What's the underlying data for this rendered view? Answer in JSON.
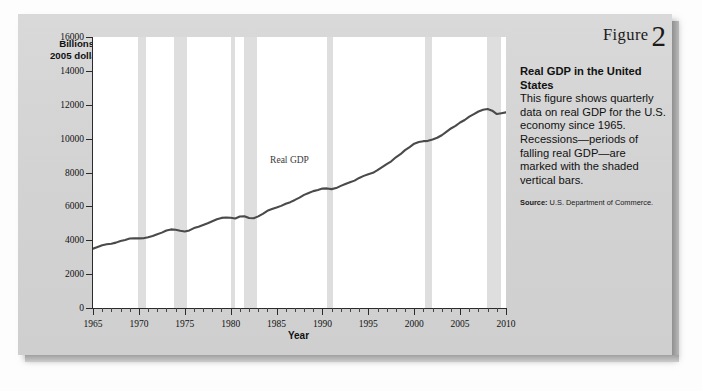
{
  "figure": {
    "label_word": "Figure",
    "number": "2",
    "caption_title": "Real GDP in the United States",
    "caption_body": "This figure shows quarterly data on real GDP for the U.S. economy since 1965. Recessions—periods of falling real GDP—are marked with the shaded vertical bars.",
    "source_label": "Source:",
    "source_text": "U.S. Department of Commerce."
  },
  "colors": {
    "panel_background": "#d5d5d5",
    "plot_background": "#ffffff",
    "line": "#4a4a4a",
    "recession_bar": "#dedede",
    "axis": "#2b2b2b",
    "text": "#111111"
  },
  "chart_data": {
    "type": "line",
    "title": "Real GDP in the United States",
    "xlabel": "Year",
    "ylabel": "Billions of 2005 dollars",
    "ylabel_line1": "Billions of",
    "ylabel_line2": "2005 dollars",
    "xlim": [
      1965,
      2010
    ],
    "ylim": [
      0,
      16000
    ],
    "yticks": [
      0,
      2000,
      4000,
      6000,
      8000,
      10000,
      12000,
      14000,
      16000
    ],
    "ytick_labels": [
      "0",
      "2000",
      "4000",
      "6000",
      "8000",
      "10000",
      "12000",
      "14000",
      "16000"
    ],
    "xticks": [
      1965,
      1970,
      1975,
      1980,
      1985,
      1990,
      1995,
      2000,
      2005,
      2010
    ],
    "xtick_labels": [
      "1965",
      "1970",
      "1975",
      "1980",
      "1985",
      "1990",
      "1995",
      "2000",
      "2005",
      "2010"
    ],
    "x_minor_tick_step": 1,
    "grid": false,
    "legend": "none",
    "series": [
      {
        "name": "Real GDP",
        "annotation": "Real GDP",
        "annotation_x": 1989.2,
        "annotation_y": 8700,
        "x": [
          1965,
          1965.5,
          1966,
          1966.5,
          1967,
          1967.5,
          1968,
          1968.5,
          1969,
          1969.5,
          1970,
          1970.5,
          1971,
          1971.5,
          1972,
          1972.5,
          1973,
          1973.5,
          1974,
          1974.5,
          1975,
          1975.5,
          1976,
          1976.5,
          1977,
          1977.5,
          1978,
          1978.5,
          1979,
          1979.5,
          1980,
          1980.5,
          1981,
          1981.5,
          1982,
          1982.5,
          1983,
          1983.5,
          1984,
          1984.5,
          1985,
          1985.5,
          1986,
          1986.5,
          1987,
          1987.5,
          1988,
          1988.5,
          1989,
          1989.5,
          1990,
          1990.5,
          1991,
          1991.5,
          1992,
          1992.5,
          1993,
          1993.5,
          1994,
          1994.5,
          1995,
          1995.5,
          1996,
          1996.5,
          1997,
          1997.5,
          1998,
          1998.5,
          1999,
          1999.5,
          2000,
          2000.5,
          2001,
          2001.5,
          2002,
          2002.5,
          2003,
          2003.5,
          2004,
          2004.5,
          2005,
          2005.5,
          2006,
          2006.5,
          2007,
          2007.5,
          2008,
          2008.5,
          2009,
          2009.5,
          2010
        ],
        "y": [
          3500,
          3600,
          3700,
          3760,
          3790,
          3860,
          3960,
          4020,
          4100,
          4120,
          4110,
          4120,
          4180,
          4250,
          4350,
          4450,
          4580,
          4640,
          4620,
          4560,
          4520,
          4580,
          4720,
          4800,
          4900,
          5000,
          5120,
          5240,
          5320,
          5340,
          5330,
          5280,
          5400,
          5420,
          5310,
          5300,
          5410,
          5560,
          5740,
          5840,
          5930,
          6030,
          6150,
          6250,
          6380,
          6520,
          6680,
          6790,
          6900,
          6970,
          7050,
          7060,
          7020,
          7080,
          7210,
          7320,
          7420,
          7520,
          7680,
          7800,
          7900,
          7980,
          8140,
          8320,
          8500,
          8660,
          8900,
          9080,
          9320,
          9500,
          9700,
          9800,
          9850,
          9870,
          9950,
          10050,
          10200,
          10400,
          10600,
          10750,
          10950,
          11100,
          11300,
          11450,
          11600,
          11700,
          11750,
          11650,
          11450,
          11500,
          11550
        ],
        "note": "Values in billions of 2005 dollars; series runs from about 3500 in 1965 to about 13000 in 2010 on the chart scale"
      }
    ],
    "recessions": [
      {
        "start": 1969.9,
        "end": 1970.8,
        "label": "1969-1970 recession"
      },
      {
        "start": 1973.8,
        "end": 1975.2,
        "label": "1973-1975 recession"
      },
      {
        "start": 1980.0,
        "end": 1980.5,
        "label": "1980 recession"
      },
      {
        "start": 1981.5,
        "end": 1982.9,
        "label": "1981-1982 recession"
      },
      {
        "start": 1990.5,
        "end": 1991.2,
        "label": "1990-1991 recession"
      },
      {
        "start": 2001.2,
        "end": 2001.9,
        "label": "2001 recession"
      },
      {
        "start": 2007.9,
        "end": 2009.5,
        "label": "2007-2009 recession"
      }
    ]
  }
}
